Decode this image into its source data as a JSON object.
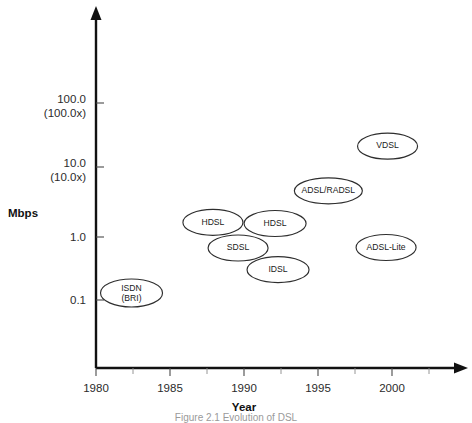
{
  "figure": {
    "caption": "Figure 2.1 Evolution of DSL"
  },
  "chart_data": {
    "type": "scatter",
    "title": "",
    "xlabel": "Year",
    "ylabel": "Mbps",
    "xlim": [
      1980,
      2002.5
    ],
    "ylim_log": [
      0.045,
      180
    ],
    "grid": false,
    "legend": "none",
    "x_ticks": [
      "1980",
      "1985",
      "1990",
      "1995",
      "2000"
    ],
    "x_tick_values": [
      1980,
      1985,
      1990,
      1995,
      2000
    ],
    "y_ticks": [
      "100.0\n(100.0x)",
      "10.0\n(10.0x)",
      "1.0",
      "0.1"
    ],
    "y_tick_labels": [
      {
        "line1": "100.0",
        "line2": "(100.0x)"
      },
      {
        "line1": "10.0",
        "line2": "(10.0x)"
      },
      {
        "line1": "1.0",
        "line2": ""
      },
      {
        "line1": "0.1",
        "line2": ""
      }
    ],
    "y_tick_values": [
      100.0,
      10.0,
      1.0,
      0.1
    ],
    "points": [
      {
        "label": "ISDN",
        "label2": "(BRI)",
        "x": 1982.4,
        "y": 0.128,
        "rx": 31,
        "ry": 14
      },
      {
        "label": "HDSL",
        "label2": "",
        "x": 1987.9,
        "y": 1.52,
        "rx": 30,
        "ry": 13
      },
      {
        "label": "SDSL",
        "label2": "",
        "x": 1989.6,
        "y": 0.62,
        "rx": 30,
        "ry": 13
      },
      {
        "label": "HDSL",
        "label2": "",
        "x": 1992.1,
        "y": 1.46,
        "rx": 31,
        "ry": 13
      },
      {
        "label": "IDSL",
        "label2": "",
        "x": 1992.3,
        "y": 0.29,
        "rx": 31,
        "ry": 13
      },
      {
        "label": "ADSL/RADSL",
        "label2": "",
        "x": 1995.7,
        "y": 4.6,
        "rx": 34,
        "ry": 13
      },
      {
        "label": "VDSL",
        "label2": "",
        "x": 1999.7,
        "y": 22.0,
        "rx": 30,
        "ry": 13
      },
      {
        "label": "ADSL-Lite",
        "label2": "",
        "x": 1999.6,
        "y": 0.63,
        "rx": 30,
        "ry": 13
      }
    ]
  }
}
